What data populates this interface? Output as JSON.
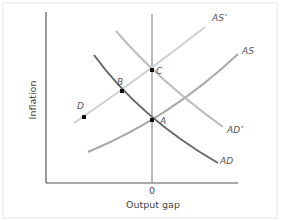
{
  "diagram": {
    "type": "AD-AS shift diagram",
    "x_axis_label": "Output gap",
    "y_axis_label": "Inflation",
    "x_tick_label": "0",
    "curves": [
      {
        "id": "AD",
        "label": "AD",
        "color": "#666666"
      },
      {
        "id": "AD_prime",
        "label": "AD’",
        "color": "#bdbdbd"
      },
      {
        "id": "AS",
        "label": "AS",
        "color": "#a8a8a8"
      },
      {
        "id": "AS_prime",
        "label": "AS’",
        "color": "#cfcfcf"
      }
    ],
    "points": [
      {
        "id": "A",
        "label": "A"
      },
      {
        "id": "B",
        "label": "B"
      },
      {
        "id": "C",
        "label": "C"
      },
      {
        "id": "D",
        "label": "D"
      }
    ],
    "colors": {
      "axis": "#555555",
      "frame": "#e3e3e3",
      "point": "#111111"
    }
  }
}
